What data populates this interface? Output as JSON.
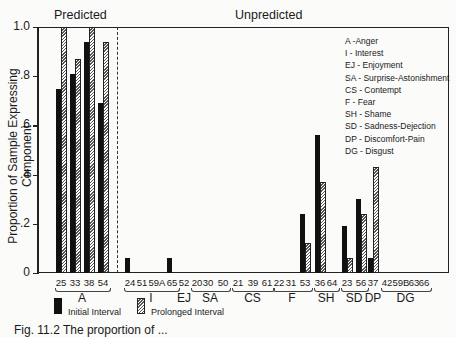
{
  "chart_data": {
    "type": "bar",
    "title": "",
    "section_labels": [
      "Predicted",
      "Unpredicted"
    ],
    "xlabel": "",
    "ylabel": "Proportion of Sample Expressing Component",
    "ylim": [
      0,
      1.0
    ],
    "yticks": [
      "0",
      ".2",
      ".4",
      ".6",
      ".8",
      "1.0"
    ],
    "grid": false,
    "legend_position": "bottom",
    "categories": [
      "25",
      "33",
      "38",
      "54",
      "24",
      "51",
      "59A",
      "65",
      "52",
      "20",
      "30",
      "50",
      "21",
      "39",
      "61",
      "22",
      "31",
      "53",
      "36",
      "64",
      "23",
      "56",
      "37",
      "42",
      "59B",
      "63",
      "66"
    ],
    "groups": [
      {
        "label": "A",
        "items": [
          "25",
          "33",
          "38",
          "54"
        ]
      },
      {
        "label": "I",
        "items": [
          "24",
          "51",
          "59A",
          "65"
        ]
      },
      {
        "label": "EJ",
        "items": [
          "52"
        ]
      },
      {
        "label": "SA",
        "items": [
          "20",
          "30",
          "50"
        ]
      },
      {
        "label": "CS",
        "items": [
          "21",
          "39",
          "61"
        ]
      },
      {
        "label": "F",
        "items": [
          "22",
          "31",
          "53"
        ]
      },
      {
        "label": "SH",
        "items": [
          "36",
          "64"
        ]
      },
      {
        "label": "SD",
        "items": [
          "23",
          "56"
        ]
      },
      {
        "label": "DP",
        "items": [
          "37"
        ]
      },
      {
        "label": "DG",
        "items": [
          "42",
          "59B",
          "63",
          "66"
        ]
      }
    ],
    "series": [
      {
        "name": "Initial Interval",
        "values": [
          0.75,
          0.81,
          0.94,
          0.69,
          0.06,
          0,
          0,
          0.06,
          0,
          0,
          0,
          0,
          0,
          0,
          0,
          0,
          0,
          0.24,
          0.56,
          0,
          0.19,
          0.3,
          0.06,
          0,
          0,
          0,
          0
        ]
      },
      {
        "name": "Prolonged Interval",
        "values": [
          1.0,
          0.87,
          1.0,
          0.94,
          0,
          0,
          0,
          0,
          0,
          0,
          0,
          0,
          0,
          0,
          0,
          0,
          0,
          0.12,
          0.37,
          0,
          0.06,
          0.24,
          0.43,
          0,
          0,
          0,
          0
        ]
      }
    ],
    "annotations": [
      "A -Anger",
      "I - Interest",
      "EJ - Enjoyment",
      "SA - Surprise-Astonishment",
      "CS - Contempt",
      "F - Fear",
      "SH - Shame",
      "SD - Sadness-Dejection",
      "DP - Discomfort-Pain",
      "DG - Disgust"
    ]
  },
  "legend": {
    "initial": "Initial Interval",
    "prolonged": "Prolonged Interval"
  },
  "caption": "Fig. 11.2   The proportion of ..."
}
